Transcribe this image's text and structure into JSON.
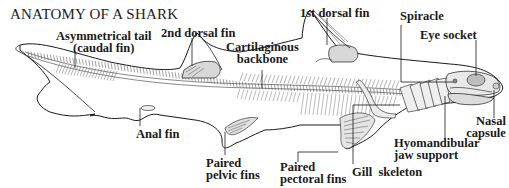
{
  "title": "ANATOMY OF A SHARK",
  "labels": {
    "tail": [
      "Asymmetrical tail",
      "(caudal fin)"
    ],
    "dorsal2": "2nd dorsal fin",
    "backbone": [
      "Cartilaginous",
      "backbone"
    ],
    "dorsal1": "1st dorsal fin",
    "spiracle": "Spiracle",
    "eye": "Eye socket",
    "anal": "Anal fin",
    "pelvic": [
      "Paired",
      "pelvic fins"
    ],
    "pectoral": [
      "Paired",
      "pectoral fins"
    ],
    "gill": "Gill  skeleton",
    "hyomandibular": [
      "Hyomandibular",
      "jaw support"
    ],
    "nasal": [
      "Nasal",
      "capsule"
    ]
  },
  "colors": {
    "ink": "#1a1a1a",
    "fin_fill": "#d8d8d8",
    "background": "#ffffff"
  }
}
